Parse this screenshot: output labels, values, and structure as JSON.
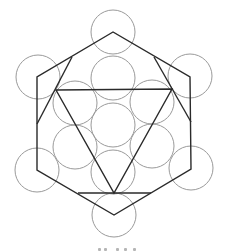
{
  "figure": {
    "colors": {
      "background": "#ffffff",
      "circle_stroke": "#9a9a9a",
      "line_stroke": "#2a2a2a"
    },
    "circle_radius": 22,
    "circles": [
      {
        "name": "circle-top-outer",
        "cx": 113,
        "cy": 32
      },
      {
        "name": "circle-upper-left-outer",
        "cx": 38,
        "cy": 77
      },
      {
        "name": "circle-upper-right-outer",
        "cx": 190,
        "cy": 76
      },
      {
        "name": "circle-lower-left-outer",
        "cx": 37,
        "cy": 170
      },
      {
        "name": "circle-lower-right-outer",
        "cx": 191,
        "cy": 168
      },
      {
        "name": "circle-bottom-outer",
        "cx": 114,
        "cy": 215
      },
      {
        "name": "circle-top-inner",
        "cx": 113,
        "cy": 78
      },
      {
        "name": "circle-upper-left-inner",
        "cx": 75,
        "cy": 103
      },
      {
        "name": "circle-upper-right-inner",
        "cx": 152,
        "cy": 102
      },
      {
        "name": "circle-center",
        "cx": 113,
        "cy": 125
      },
      {
        "name": "circle-lower-left-inner",
        "cx": 75,
        "cy": 147
      },
      {
        "name": "circle-lower-right-inner",
        "cx": 152,
        "cy": 146
      },
      {
        "name": "circle-bottom-inner",
        "cx": 113,
        "cy": 172
      }
    ],
    "hexagon_points": "113,32 37,77 37,170 114,215 191,169 190,77",
    "inner_triangle_points": "56,90 172,89 114,193",
    "extra_lines": [
      {
        "name": "line-left-diagonal",
        "x1": 72,
        "y1": 57,
        "x2": 37,
        "y2": 124
      },
      {
        "name": "line-right-diagonal",
        "x1": 154,
        "y1": 57,
        "x2": 191,
        "y2": 122
      },
      {
        "name": "line-bottom-chord",
        "x1": 78,
        "y1": 193,
        "x2": 151,
        "y2": 193
      }
    ]
  },
  "caption": {
    "visible": "partially cut off at bottom edge"
  }
}
